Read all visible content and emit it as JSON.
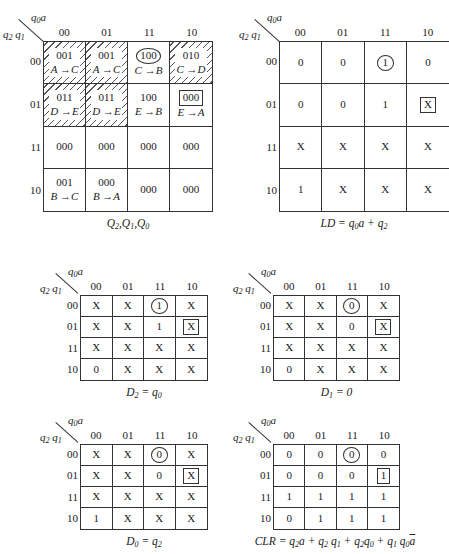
{
  "axis": {
    "col_var": "q0a",
    "row_var": "q2 q1",
    "col_labels": [
      "00",
      "01",
      "11",
      "10"
    ],
    "row_labels": [
      "00",
      "01",
      "11",
      "10"
    ]
  },
  "maps": [
    {
      "id": "next-state",
      "caption": "Q2,Q1,Q0",
      "cells": [
        [
          {
            "v": "001",
            "t": "A →C",
            "hatch": true
          },
          {
            "v": "001",
            "t": "A →C",
            "hatch": true
          },
          {
            "v": "100",
            "t": "C →B",
            "mark": "circle"
          },
          {
            "v": "010",
            "t": "C →D",
            "hatch": true
          }
        ],
        [
          {
            "v": "011",
            "t": "D →E",
            "hatch": true
          },
          {
            "v": "011",
            "t": "D →E",
            "hatch": true
          },
          {
            "v": "100",
            "t": "E →B"
          },
          {
            "v": "000",
            "t": "E →A",
            "mark": "box"
          }
        ],
        [
          {
            "v": "000"
          },
          {
            "v": "000"
          },
          {
            "v": "000"
          },
          {
            "v": "000"
          }
        ],
        [
          {
            "v": "001",
            "t": "B →C"
          },
          {
            "v": "000",
            "t": "B →A"
          },
          {
            "v": "000"
          },
          {
            "v": "000"
          }
        ]
      ]
    },
    {
      "id": "ld",
      "caption": "LD = q0a + q2",
      "cells": [
        [
          {
            "v": "0"
          },
          {
            "v": "0"
          },
          {
            "v": "1",
            "mark": "circle"
          },
          {
            "v": "0"
          }
        ],
        [
          {
            "v": "0"
          },
          {
            "v": "0"
          },
          {
            "v": "1"
          },
          {
            "v": "X",
            "mark": "box"
          }
        ],
        [
          {
            "v": "X"
          },
          {
            "v": "X"
          },
          {
            "v": "X"
          },
          {
            "v": "X"
          }
        ],
        [
          {
            "v": "1"
          },
          {
            "v": "X"
          },
          {
            "v": "X"
          },
          {
            "v": "X"
          }
        ]
      ]
    },
    {
      "id": "d2",
      "caption": "D2 = q0",
      "cells": [
        [
          {
            "v": "X"
          },
          {
            "v": "X"
          },
          {
            "v": "1",
            "mark": "circle"
          },
          {
            "v": "X"
          }
        ],
        [
          {
            "v": "X"
          },
          {
            "v": "X"
          },
          {
            "v": "1"
          },
          {
            "v": "X",
            "mark": "box"
          }
        ],
        [
          {
            "v": "X"
          },
          {
            "v": "X"
          },
          {
            "v": "X"
          },
          {
            "v": "X"
          }
        ],
        [
          {
            "v": "0"
          },
          {
            "v": "X"
          },
          {
            "v": "X"
          },
          {
            "v": "X"
          }
        ]
      ]
    },
    {
      "id": "d1",
      "caption": "D1 = 0",
      "cells": [
        [
          {
            "v": "X"
          },
          {
            "v": "X"
          },
          {
            "v": "0",
            "mark": "circle"
          },
          {
            "v": "X"
          }
        ],
        [
          {
            "v": "X"
          },
          {
            "v": "X"
          },
          {
            "v": "0"
          },
          {
            "v": "X",
            "mark": "box"
          }
        ],
        [
          {
            "v": "X"
          },
          {
            "v": "X"
          },
          {
            "v": "X"
          },
          {
            "v": "X"
          }
        ],
        [
          {
            "v": "0"
          },
          {
            "v": "X"
          },
          {
            "v": "X"
          },
          {
            "v": "X"
          }
        ]
      ]
    },
    {
      "id": "d0",
      "caption": "D0 = q2",
      "cells": [
        [
          {
            "v": "X"
          },
          {
            "v": "X"
          },
          {
            "v": "0",
            "mark": "circle"
          },
          {
            "v": "X"
          }
        ],
        [
          {
            "v": "X"
          },
          {
            "v": "X"
          },
          {
            "v": "0"
          },
          {
            "v": "X",
            "mark": "box"
          }
        ],
        [
          {
            "v": "X"
          },
          {
            "v": "X"
          },
          {
            "v": "X"
          },
          {
            "v": "X"
          }
        ],
        [
          {
            "v": "1"
          },
          {
            "v": "X"
          },
          {
            "v": "X"
          },
          {
            "v": "X"
          }
        ]
      ]
    },
    {
      "id": "clr",
      "caption": "CLR = q2a + q2 q1 + q2q0 + q1 q0ā",
      "cells": [
        [
          {
            "v": "0"
          },
          {
            "v": "0"
          },
          {
            "v": "0",
            "mark": "circle"
          },
          {
            "v": "0"
          }
        ],
        [
          {
            "v": "0"
          },
          {
            "v": "0"
          },
          {
            "v": "0"
          },
          {
            "v": "1",
            "mark": "box"
          }
        ],
        [
          {
            "v": "1"
          },
          {
            "v": "1"
          },
          {
            "v": "1"
          },
          {
            "v": "1"
          }
        ],
        [
          {
            "v": "0"
          },
          {
            "v": "1"
          },
          {
            "v": "1"
          },
          {
            "v": "1"
          }
        ]
      ]
    }
  ]
}
